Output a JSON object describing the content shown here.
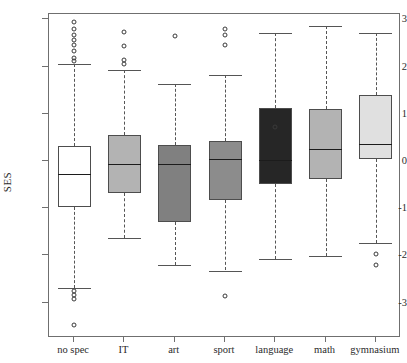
{
  "chart_data": {
    "type": "box",
    "title": "",
    "xlabel": "",
    "ylabel": "SES",
    "ylim": [
      -3.6,
      3.2
    ],
    "yticks": [
      3,
      2,
      1,
      0,
      -1,
      -2,
      -3
    ],
    "ytick_labels": [
      "3",
      "2",
      "1",
      "0",
      "-1",
      "-2",
      "-3"
    ],
    "grid": false,
    "legend": "none",
    "categories": [
      "no spec",
      "IT",
      "art",
      "sport",
      "language",
      "math",
      "gymnasium"
    ],
    "boxes": [
      {
        "category": "no spec",
        "fill": "#ffffff",
        "q1": -0.97,
        "median": -0.28,
        "q3": 0.32,
        "whisker_low": -2.69,
        "whisker_high": 2.06,
        "outliers": [
          2.95,
          2.8,
          2.68,
          2.56,
          2.45,
          2.33,
          2.19,
          2.12,
          -2.76,
          -2.84,
          -2.92,
          -3.47
        ]
      },
      {
        "category": "IT",
        "fill": "#b3b3b3",
        "q1": -0.68,
        "median": -0.06,
        "q3": 0.55,
        "whisker_low": -1.63,
        "whisker_high": 1.93,
        "outliers": [
          2.73,
          2.44,
          2.14,
          2.06
        ]
      },
      {
        "category": "art",
        "fill": "#808080",
        "q1": -1.29,
        "median": -0.06,
        "q3": 0.34,
        "whisker_low": -2.2,
        "whisker_high": 1.63,
        "outliers": [
          2.65
        ]
      },
      {
        "category": "sport",
        "fill": "#8c8c8c",
        "q1": -0.83,
        "median": 0.04,
        "q3": 0.42,
        "whisker_low": -2.32,
        "whisker_high": 1.82,
        "outliers": [
          2.8,
          2.68,
          2.45,
          -2.85
        ]
      },
      {
        "category": "language",
        "fill": "#262626",
        "q1": -0.49,
        "median": 0.02,
        "q3": 1.12,
        "whisker_low": -2.07,
        "whisker_high": 2.71,
        "outliers": [
          0.72
        ]
      },
      {
        "category": "math",
        "fill": "#b3b3b3",
        "q1": -0.38,
        "median": 0.26,
        "q3": 1.11,
        "whisker_low": -2.01,
        "whisker_high": 2.87,
        "outliers": []
      },
      {
        "category": "gymnasium",
        "fill": "#e0e0e0",
        "q1": 0.04,
        "median": 0.36,
        "q3": 1.4,
        "whisker_low": -1.74,
        "whisker_high": 2.71,
        "outliers": [
          -1.97,
          -2.2
        ]
      }
    ]
  },
  "axis": {
    "y_title": "SES"
  }
}
